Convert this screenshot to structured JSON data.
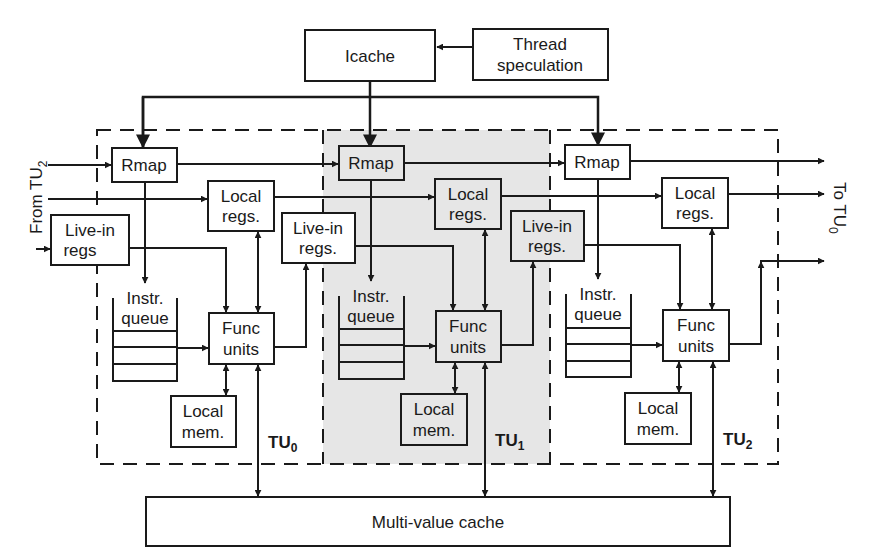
{
  "diagram": {
    "type": "block-diagram",
    "colors": {
      "line": "#1a1a1a",
      "tu1_shade": "#e6e6e6",
      "background": "#ffffff"
    },
    "top": {
      "icache": "Icache",
      "thread_spec": [
        "Thread",
        "speculation"
      ]
    },
    "side_labels": {
      "from": "From TU",
      "from_sub": "2",
      "to": "To TU",
      "to_sub": "0"
    },
    "units": [
      {
        "name": "TU",
        "sub": "0",
        "rmap": "Rmap",
        "local_regs": [
          "Local",
          "regs."
        ],
        "live_in": [
          "Live-in",
          "regs"
        ],
        "instr_queue": [
          "Instr.",
          "queue"
        ],
        "func_units": [
          "Func",
          "units"
        ],
        "local_mem": [
          "Local",
          "mem."
        ]
      },
      {
        "name": "TU",
        "sub": "1",
        "rmap": "Rmap",
        "local_regs": [
          "Local",
          "regs."
        ],
        "live_in": [
          "Live-in",
          "regs."
        ],
        "instr_queue": [
          "Instr.",
          "queue"
        ],
        "func_units": [
          "Func",
          "units"
        ],
        "local_mem": [
          "Local",
          "mem."
        ]
      },
      {
        "name": "TU",
        "sub": "2",
        "rmap": "Rmap",
        "local_regs": [
          "Local",
          "regs."
        ],
        "live_in": [
          "Live-in",
          "regs."
        ],
        "instr_queue": [
          "Instr.",
          "queue"
        ],
        "func_units": [
          "Func",
          "units"
        ],
        "local_mem": [
          "Local",
          "mem."
        ]
      }
    ],
    "bottom": {
      "mvc": "Multi-value cache"
    }
  }
}
